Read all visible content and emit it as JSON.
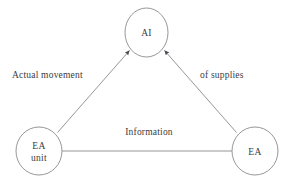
{
  "diagram": {
    "type": "triangle-flow-diagram",
    "background_color": "#ffffff",
    "stroke_color": "#8a8a8f",
    "text_color": "#3b3b3b",
    "nodes": [
      {
        "id": "ai",
        "label_line1": "AI",
        "label_line2": "",
        "shape": "circle",
        "cx": 146.5,
        "cy": 32.5,
        "rx": 21.5,
        "ry": 24.5
      },
      {
        "id": "ea-unit",
        "label_line1": "EA",
        "label_line2": "unit",
        "shape": "circle",
        "cx": 39,
        "cy": 151,
        "rx": 23,
        "ry": 24
      },
      {
        "id": "ea",
        "label_line1": "EA",
        "label_line2": "",
        "shape": "circle",
        "cx": 255,
        "cy": 151,
        "rx": 23,
        "ry": 24
      }
    ],
    "edges": [
      {
        "id": "ea-unit-to-ai",
        "from": "ea-unit",
        "to": "ai",
        "arrowhead_at_target": true,
        "label": "Actual movement",
        "label_x": 12,
        "label_y": 78
      },
      {
        "id": "ea-to-ai",
        "from": "ea",
        "to": "ai",
        "arrowhead_at_target": true,
        "label": "of supplies",
        "label_x": 200,
        "label_y": 78
      },
      {
        "id": "ea-unit-to-ea",
        "from": "ea-unit",
        "to": "ea",
        "arrowhead_at_target": false,
        "label": "Information",
        "label_x": 149,
        "label_y": 135
      }
    ]
  }
}
